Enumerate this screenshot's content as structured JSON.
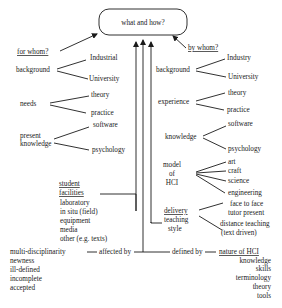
{
  "diagram": {
    "root": "what and how?",
    "left_branch": {
      "title": "for whom?",
      "background": {
        "label": "background",
        "children": [
          "Industrial",
          "University"
        ]
      },
      "needs": {
        "label": "needs",
        "children": [
          "theory",
          "practice"
        ]
      },
      "present_knowledge": {
        "label_line1": "present",
        "label_line2": "knowledge",
        "children": [
          "software",
          "psychology"
        ]
      }
    },
    "right_branch": {
      "title": "by whom?",
      "background": {
        "label": "background",
        "children": [
          "Industry",
          "University"
        ]
      },
      "experience": {
        "label": "experience",
        "children": [
          "theory",
          "practice"
        ]
      },
      "knowledge": {
        "label": "knowledge",
        "children": [
          "software",
          "psychology"
        ]
      },
      "model_of_hci": {
        "label_line1": "model",
        "label_line2": "of",
        "label_line3": "HCI",
        "children": [
          "art",
          "craft",
          "science",
          "engineering"
        ]
      }
    },
    "student_facilities": {
      "title_line1": "student",
      "title_line2": "facilities",
      "items": [
        "laboratory",
        "in situ (field)",
        "equipment",
        "media",
        "other (e.g. texts)"
      ]
    },
    "delivery": {
      "title": "delivery",
      "label_line2": "teaching",
      "label_line3": "style",
      "children": [
        "face to face",
        "tutor present",
        "distance teaching",
        "(text driven)"
      ]
    },
    "affected_by": {
      "label": "affected by",
      "items": [
        "multi-disciplinarity",
        "newness",
        "ill-defined",
        "incomplete",
        "accepted"
      ]
    },
    "defined_by": {
      "label": "defined by",
      "title": "nature of HCI",
      "items": [
        "knowledge",
        "skills",
        "terminology",
        "theory",
        "tools"
      ]
    }
  }
}
